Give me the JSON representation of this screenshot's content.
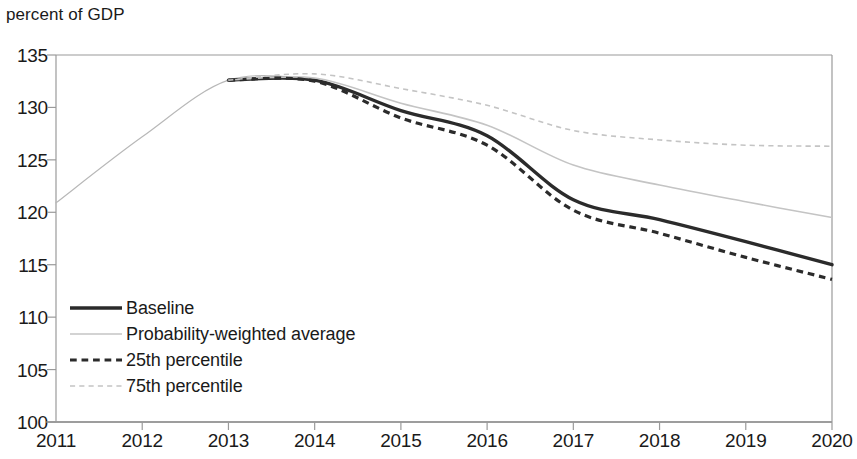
{
  "chart_data": {
    "type": "line",
    "title": "percent of GDP",
    "xlabel": "",
    "ylabel": "percent of GDP",
    "xlim": [
      2011,
      2020
    ],
    "ylim": [
      100,
      135
    ],
    "grid": false,
    "legend_position": "inside-lower-left",
    "x_tick_labels": [
      "2011",
      "2012",
      "2013",
      "2014",
      "2015",
      "2016",
      "2017",
      "2018",
      "2019",
      "2020"
    ],
    "y_tick_labels": [
      "100",
      "105",
      "110",
      "115",
      "120",
      "125",
      "130",
      "135"
    ],
    "x": [
      2011,
      2012,
      2013,
      2014,
      2015,
      2016,
      2017,
      2018,
      2019,
      2020
    ],
    "history": {
      "name": "History",
      "x": [
        2011,
        2012,
        2013,
        2014
      ],
      "values": [
        120.9,
        127.2,
        132.6,
        132.7
      ],
      "color": "#b8b8b8",
      "style": "solid",
      "width": 1.2
    },
    "series": [
      {
        "name": "Baseline",
        "values": [
          120.9,
          127.2,
          132.6,
          132.6,
          129.7,
          127.3,
          121.2,
          119.3,
          117.2,
          115.0
        ],
        "color": "#2b2b2b",
        "style": "solid",
        "width": 3.4
      },
      {
        "name": "Probability-weighted average",
        "values": [
          120.9,
          127.2,
          132.6,
          132.8,
          130.4,
          128.3,
          124.5,
          122.6,
          121.0,
          119.5
        ],
        "color": "#c4c4c4",
        "style": "solid",
        "width": 1.6
      },
      {
        "name": "25th percentile",
        "values": [
          120.9,
          127.2,
          132.6,
          132.5,
          129.0,
          126.4,
          120.2,
          118.0,
          115.7,
          113.6
        ],
        "color": "#2b2b2b",
        "style": "dashed",
        "width": 3.2
      },
      {
        "name": "75th percentile",
        "values": [
          120.9,
          127.2,
          132.6,
          133.2,
          131.8,
          130.2,
          127.8,
          126.9,
          126.4,
          126.3
        ],
        "color": "#c4c4c4",
        "style": "dotted-dash",
        "width": 1.6
      }
    ],
    "axis_color": "#9a9a9a",
    "text_color": "#1a1a1a"
  },
  "legend": {
    "items": [
      {
        "label": "Baseline"
      },
      {
        "label": "Probability-weighted average"
      },
      {
        "label": "25th percentile"
      },
      {
        "label": "75th percentile"
      }
    ]
  }
}
